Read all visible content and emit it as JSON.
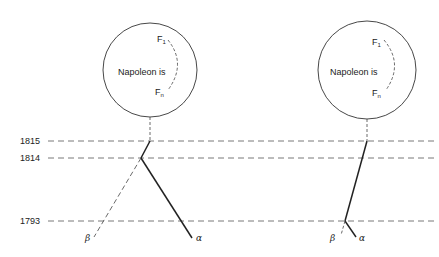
{
  "diagram": {
    "years": [
      {
        "label": "1815",
        "y": 141
      },
      {
        "label": "1814",
        "y": 158
      },
      {
        "label": "1793",
        "y": 221
      }
    ],
    "nodes": [
      {
        "text": "Napoleon is",
        "f_top": "F",
        "f_top_sub": "1",
        "f_bottom": "F",
        "f_bottom_sub": "n"
      },
      {
        "text": "Napoleon is",
        "f_top": "F",
        "f_top_sub": "1",
        "f_bottom": "F",
        "f_bottom_sub": "n"
      }
    ],
    "branch_labels": {
      "beta": "β",
      "alpha": "α"
    },
    "colors": {
      "line": "#222222",
      "background": "#ffffff"
    }
  }
}
